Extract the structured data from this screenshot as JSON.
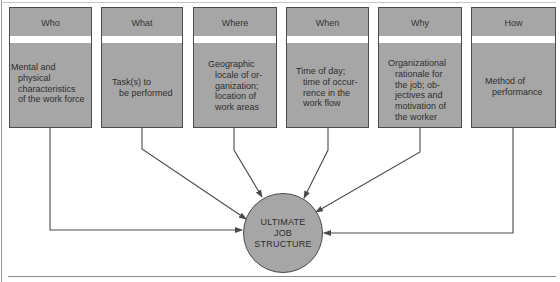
{
  "diagram": {
    "boxes": [
      {
        "title": "Who",
        "lines": [
          "Mental and",
          "physical",
          "characteristics",
          "of the work force"
        ]
      },
      {
        "title": "What",
        "lines": [
          "Task(s) to",
          "be performed"
        ]
      },
      {
        "title": "Where",
        "lines": [
          "Geographic",
          "locale of or-",
          "ganization;",
          "location of",
          "work areas"
        ]
      },
      {
        "title": "When",
        "lines": [
          "Time of day;",
          "time of occur-",
          "rence in the",
          "work flow"
        ]
      },
      {
        "title": "Why",
        "lines": [
          "Organizational",
          "rationale for",
          "the job; ob-",
          "jectives and",
          "motivation of",
          "the worker"
        ]
      },
      {
        "title": "How",
        "lines": [
          "Method of",
          "performance"
        ]
      }
    ],
    "center": {
      "lines": [
        "ULTIMATE",
        "JOB",
        "STRUCTURE"
      ]
    },
    "colors": {
      "box_fill": "#a6a6a6",
      "outline": "#4a4a4a",
      "stripe": "#ffffff"
    }
  }
}
